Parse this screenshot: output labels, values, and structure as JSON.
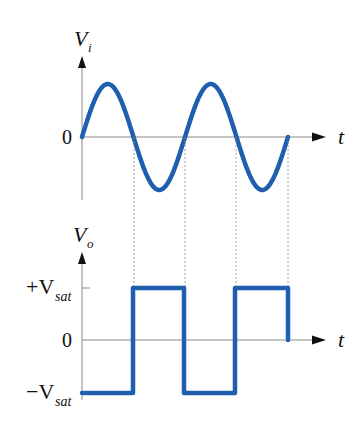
{
  "colors": {
    "wave": "#1f5fae",
    "axis": "#8a8a8a",
    "text": "#111111"
  },
  "input_plot": {
    "y_label_main": "V",
    "y_label_sub": "i",
    "zero_label": "0",
    "x_label": "t",
    "signal": "sine",
    "cycles": 2
  },
  "output_plot": {
    "y_label_main": "V",
    "y_label_sub": "o",
    "pos_label_sign": "+V",
    "pos_label_sub": "sat",
    "zero_label": "0",
    "neg_label_sign": "−V",
    "neg_label_sub": "sat",
    "x_label": "t",
    "signal": "square",
    "levels": [
      "-Vsat",
      "+Vsat",
      "-Vsat",
      "+Vsat",
      "0"
    ]
  },
  "chart_data": [
    {
      "type": "line",
      "title": "Input voltage",
      "xlabel": "t",
      "ylabel": "V_i",
      "y_ticks": [
        "0"
      ],
      "series": [
        {
          "name": "V_i",
          "shape": "sine",
          "cycles": 2,
          "start_phase_deg": 0
        }
      ],
      "zero_crossings_x_px": [
        134,
        185,
        237,
        288
      ]
    },
    {
      "type": "line",
      "title": "Output voltage",
      "xlabel": "t",
      "ylabel": "V_o",
      "y_ticks": [
        "+V_sat",
        "0",
        "-V_sat"
      ],
      "series": [
        {
          "name": "V_o",
          "shape": "square",
          "segments": [
            {
              "from": "0",
              "to": "T/4",
              "level": "-V_sat"
            },
            {
              "from": "T/4",
              "to": "3T/4",
              "level": "+V_sat"
            },
            {
              "from": "3T/4",
              "to": "5T/4",
              "level": "-V_sat"
            },
            {
              "from": "5T/4",
              "to": "7T/4",
              "level": "+V_sat"
            }
          ]
        }
      ],
      "transition_x_px": [
        133,
        184,
        235,
        288
      ]
    }
  ]
}
